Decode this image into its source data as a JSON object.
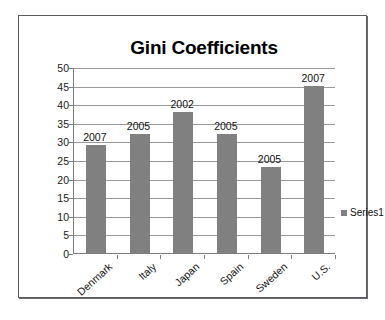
{
  "chart_data": {
    "type": "bar",
    "title": "Gini Coefficients",
    "xlabel": "",
    "ylabel": "",
    "categories": [
      "Denmark",
      "Italy",
      "Japan",
      "Spain",
      "Sweden",
      "U.S."
    ],
    "values": [
      29,
      32,
      38,
      32,
      23,
      45
    ],
    "point_labels": [
      "2007",
      "2005",
      "2002",
      "2005",
      "2005",
      "2007"
    ],
    "series": [
      {
        "name": "Series1",
        "values": [
          29,
          32,
          38,
          32,
          23,
          45
        ],
        "color": "#808080"
      }
    ],
    "ylim": [
      0,
      50
    ],
    "ytick_step": 5,
    "ytick_labels": [
      "50",
      "45",
      "40",
      "35",
      "30",
      "25",
      "20",
      "15",
      "10",
      "5",
      "0"
    ],
    "grid": true,
    "legend_position": "right",
    "legend_entries": [
      "Series1"
    ]
  },
  "legend": {
    "series1_label": "Series1",
    "swatch_color": "#808080"
  },
  "frame": {
    "border_color": "#5a5a5f",
    "background": "#ffffff"
  }
}
